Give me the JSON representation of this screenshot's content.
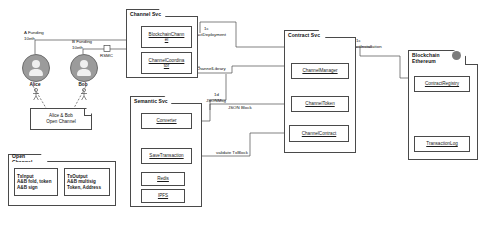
{
  "diagram": {
    "type": "uml-component-diagram"
  },
  "actors": [
    {
      "name": "Alice",
      "funding_label": "A Funding",
      "funding_amount": "10eth"
    },
    {
      "name": "Bob",
      "funding_label": "B Funding",
      "funding_amount": "10eth"
    }
  ],
  "notes": {
    "open_channel": "Alice & Bob\nOpen Channel"
  },
  "legend": {
    "title": "Open Channel",
    "left": {
      "header": "TxInput",
      "line1": "A&B fold, token",
      "line2": "A&B sign"
    },
    "right": {
      "header": "TxOutput",
      "line1": "A&B multisig",
      "line2": "Token, Address"
    }
  },
  "packages": [
    {
      "id": "channel-svc",
      "title": "Channel Svc",
      "classes": [
        {
          "id": "blockchain-channel",
          "label": "BlockchainChann\nel"
        },
        {
          "id": "channel-coordinator",
          "label": "ChannelCoordina\ntor"
        }
      ]
    },
    {
      "id": "semantic-svc",
      "title": "Semantic Svc",
      "classes": [
        {
          "id": "converter",
          "label": "Converter"
        },
        {
          "id": "save-transaction",
          "label": "SaveTransaction"
        },
        {
          "id": "redis",
          "label": "Redis"
        },
        {
          "id": "ipfs",
          "label": "IPFS"
        }
      ]
    },
    {
      "id": "contract-svc",
      "title": "Contract Svc",
      "classes": [
        {
          "id": "channel-manager",
          "label": "ChannelManager"
        },
        {
          "id": "channel-token",
          "label": "ChannelToken"
        },
        {
          "id": "channel-contract",
          "label": "ChannelContract"
        }
      ]
    },
    {
      "id": "blockchain-ethereum",
      "title": "Blockchain\nEthereum",
      "classes": [
        {
          "id": "contract-registry",
          "label": "ContractRegistry"
        },
        {
          "id": "transaction-log",
          "label": "TransactionLog"
        }
      ]
    }
  ],
  "edge_labels": {
    "rsmc": "RSMC",
    "contract_deployment_seq": "1c",
    "contract_deployment": "ContractDeployment",
    "contract_installation_seq": "1c",
    "contract_installation": "ContractInstallation",
    "channel_library": "ChannelLibrary",
    "jsonmsg_seq": "1d",
    "jsonmsg": "JSONMsg",
    "json_block": "JSON Block",
    "validate_txblock": "validate TxBlock"
  },
  "colors": {
    "line": "#4a4a4a",
    "text": "#111111",
    "actor_fill": "#9b9b9b",
    "background": "#ffffff"
  }
}
